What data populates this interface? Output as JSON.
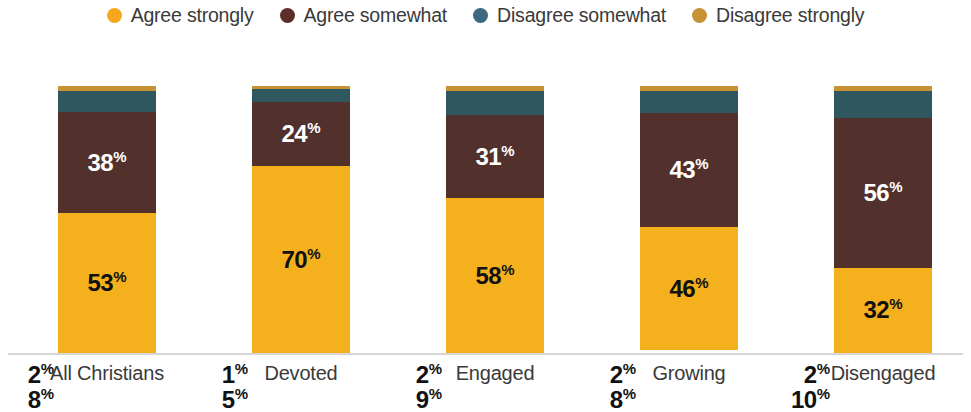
{
  "legend": {
    "items": [
      {
        "label": "Agree strongly",
        "color": "#F5A81C",
        "icon": "legend-dot-icon"
      },
      {
        "label": "Agree somewhat",
        "color": "#5C2E2A",
        "icon": "legend-dot-icon"
      },
      {
        "label": "Disagree somewhat",
        "color": "#3D6980",
        "icon": "legend-dot-icon"
      },
      {
        "label": "Disagree strongly",
        "color": "#C79234",
        "icon": "legend-dot-icon"
      }
    ]
  },
  "colors": {
    "agree_strongly": "#F5B01E",
    "agree_somewhat": "#52302C",
    "disagree_somewhat": "#2E5760",
    "disagree_strongly": "#C79234",
    "baseline": "#d6d6d6",
    "label_dark": "#111111",
    "label_light": "#ffffff",
    "axis_text": "#3a3a3a"
  },
  "chart_data": {
    "type": "bar",
    "title": "",
    "xlabel": "",
    "ylabel": "",
    "ylim": [
      0,
      100
    ],
    "grid": false,
    "stacked": true,
    "orientation": "vertical",
    "legend_position": "top-center",
    "categories": [
      "All Christians",
      "Devoted",
      "Engaged",
      "Growing",
      "Disengaged"
    ],
    "series": [
      {
        "name": "Agree strongly",
        "color": "#F5B01E",
        "values": [
          53,
          70,
          58,
          46,
          32
        ]
      },
      {
        "name": "Agree somewhat",
        "color": "#52302C",
        "values": [
          38,
          24,
          31,
          43,
          56
        ]
      },
      {
        "name": "Disagree somewhat",
        "color": "#2E5760",
        "values": [
          8,
          5,
          9,
          8,
          10
        ]
      },
      {
        "name": "Disagree strongly",
        "color": "#C79234",
        "values": [
          2,
          1,
          2,
          2,
          2
        ]
      }
    ],
    "value_suffix": "%"
  },
  "bars": [
    {
      "category": "All Christians",
      "segments": [
        {
          "name": "Disagree strongly",
          "value": "2",
          "suffix": "%",
          "placement": "outside"
        },
        {
          "name": "Disagree somewhat",
          "value": "8",
          "suffix": "%",
          "placement": "outside"
        },
        {
          "name": "Agree somewhat",
          "value": "38",
          "suffix": "%",
          "placement": "inside"
        },
        {
          "name": "Agree strongly",
          "value": "53",
          "suffix": "%",
          "placement": "inside"
        }
      ]
    },
    {
      "category": "Devoted",
      "segments": [
        {
          "name": "Disagree strongly",
          "value": "1",
          "suffix": "%",
          "placement": "outside"
        },
        {
          "name": "Disagree somewhat",
          "value": "5",
          "suffix": "%",
          "placement": "outside"
        },
        {
          "name": "Agree somewhat",
          "value": "24",
          "suffix": "%",
          "placement": "inside"
        },
        {
          "name": "Agree strongly",
          "value": "70",
          "suffix": "%",
          "placement": "inside"
        }
      ]
    },
    {
      "category": "Engaged",
      "segments": [
        {
          "name": "Disagree strongly",
          "value": "2",
          "suffix": "%",
          "placement": "outside"
        },
        {
          "name": "Disagree somewhat",
          "value": "9",
          "suffix": "%",
          "placement": "outside"
        },
        {
          "name": "Agree somewhat",
          "value": "31",
          "suffix": "%",
          "placement": "inside"
        },
        {
          "name": "Agree strongly",
          "value": "58",
          "suffix": "%",
          "placement": "inside"
        }
      ]
    },
    {
      "category": "Growing",
      "segments": [
        {
          "name": "Disagree strongly",
          "value": "2",
          "suffix": "%",
          "placement": "outside"
        },
        {
          "name": "Disagree somewhat",
          "value": "8",
          "suffix": "%",
          "placement": "outside"
        },
        {
          "name": "Agree somewhat",
          "value": "43",
          "suffix": "%",
          "placement": "inside"
        },
        {
          "name": "Agree strongly",
          "value": "46",
          "suffix": "%",
          "placement": "inside"
        }
      ]
    },
    {
      "category": "Disengaged",
      "segments": [
        {
          "name": "Disagree strongly",
          "value": "2",
          "suffix": "%",
          "placement": "outside"
        },
        {
          "name": "Disagree somewhat",
          "value": "10",
          "suffix": "%",
          "placement": "outside"
        },
        {
          "name": "Agree somewhat",
          "value": "56",
          "suffix": "%",
          "placement": "inside"
        },
        {
          "name": "Agree strongly",
          "value": "32",
          "suffix": "%",
          "placement": "inside"
        }
      ]
    }
  ]
}
